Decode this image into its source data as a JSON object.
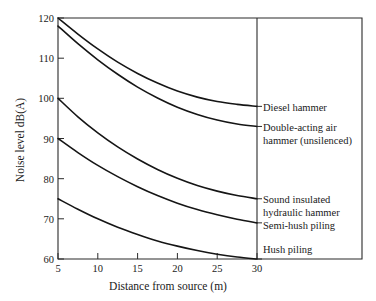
{
  "chart_data": {
    "type": "line",
    "title": "",
    "xlabel": "Distance from source (m)",
    "ylabel": "Noise level dB(A)",
    "xlim": [
      5,
      30
    ],
    "ylim": [
      60,
      120
    ],
    "xticks": [
      5,
      10,
      15,
      20,
      25,
      30
    ],
    "yticks": [
      60,
      70,
      80,
      90,
      100,
      110,
      120
    ],
    "xtick_labels": [
      "5",
      "10",
      "15",
      "20",
      "25",
      "30"
    ],
    "ytick_labels": [
      "60",
      "70",
      "80",
      "90",
      "100",
      "110",
      "120"
    ],
    "grid": false,
    "legend_position": "right-inline-labels",
    "x": [
      5,
      7.5,
      10,
      12.5,
      15,
      17.5,
      20,
      22.5,
      25,
      27.5,
      30
    ],
    "series": [
      {
        "name": "Diesel hammer",
        "label": "Diesel hammer",
        "values": [
          120.0,
          116.0,
          112.3,
          109.0,
          106.2,
          103.8,
          101.8,
          100.3,
          99.2,
          98.5,
          98.0
        ]
      },
      {
        "name": "Double-acting air hammer (unsilenced)",
        "label": "Double-acting air hammer (unsilenced)",
        "label_line1": "Double-acting air",
        "label_line2": "hammer (unsilenced)",
        "values": [
          118.0,
          113.6,
          109.6,
          106.0,
          102.8,
          100.1,
          97.8,
          96.0,
          94.6,
          93.6,
          93.0
        ]
      },
      {
        "name": "Sound insulated hydraulic hammer",
        "label": "Sound insulated hydraulic hammer",
        "label_line1": "Sound insulated",
        "label_line2": "hydraulic hammer",
        "values": [
          100.0,
          95.4,
          91.4,
          87.9,
          84.9,
          82.3,
          80.1,
          78.3,
          76.9,
          75.8,
          75.0
        ]
      },
      {
        "name": "Semi-hush piling",
        "label": "Semi-hush piling",
        "values": [
          90.0,
          86.5,
          83.3,
          80.5,
          78.0,
          75.8,
          73.9,
          72.3,
          71.0,
          69.9,
          69.0
        ]
      },
      {
        "name": "Hush piling",
        "label": "Hush piling",
        "values": [
          75.0,
          72.4,
          70.0,
          67.9,
          66.1,
          64.5,
          63.2,
          62.1,
          61.2,
          60.5,
          60.0
        ]
      }
    ]
  },
  "axes": {
    "x_title": "Distance from source (m)",
    "y_title": "Noise level dB(A)"
  }
}
